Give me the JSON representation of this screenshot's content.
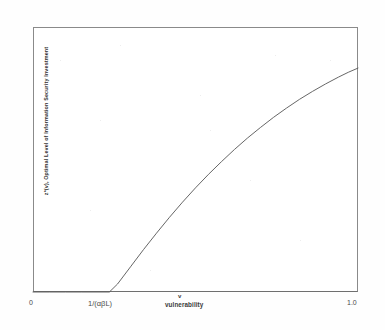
{
  "chart_data": {
    "type": "line",
    "title": "",
    "subtitle": "",
    "xlabel": "vulnerability",
    "x_variable_symbol": "v",
    "ylabel": "z*(v), Optimal Level of Information Security Investment",
    "xlim": [
      0,
      1.0
    ],
    "ylim": [
      0,
      1.0
    ],
    "grid": false,
    "legend": null,
    "xtick_labels": [
      "0",
      "1/(αβL)",
      "1.0"
    ],
    "xtick_values": [
      0,
      0.235,
      1.0
    ],
    "ytick_labels": [],
    "annotations": [],
    "series": [
      {
        "name": "z*(v)",
        "color": "#555555",
        "x": [
          0.0,
          0.05,
          0.1,
          0.15,
          0.2,
          0.235,
          0.26,
          0.3,
          0.34,
          0.38,
          0.42,
          0.46,
          0.5,
          0.54,
          0.58,
          0.62,
          0.66,
          0.7,
          0.74,
          0.78,
          0.82,
          0.86,
          0.9,
          0.94,
          0.97,
          1.0
        ],
        "y": [
          0.0,
          0.0,
          0.0,
          0.0,
          0.0,
          0.0,
          0.03,
          0.095,
          0.16,
          0.222,
          0.282,
          0.339,
          0.393,
          0.444,
          0.492,
          0.538,
          0.581,
          0.621,
          0.659,
          0.694,
          0.727,
          0.757,
          0.785,
          0.811,
          0.829,
          0.845
        ]
      }
    ]
  },
  "figure": {
    "background_color": "#fefefe",
    "frame_color": "#8a8a8a",
    "curve_color": "#555555"
  }
}
